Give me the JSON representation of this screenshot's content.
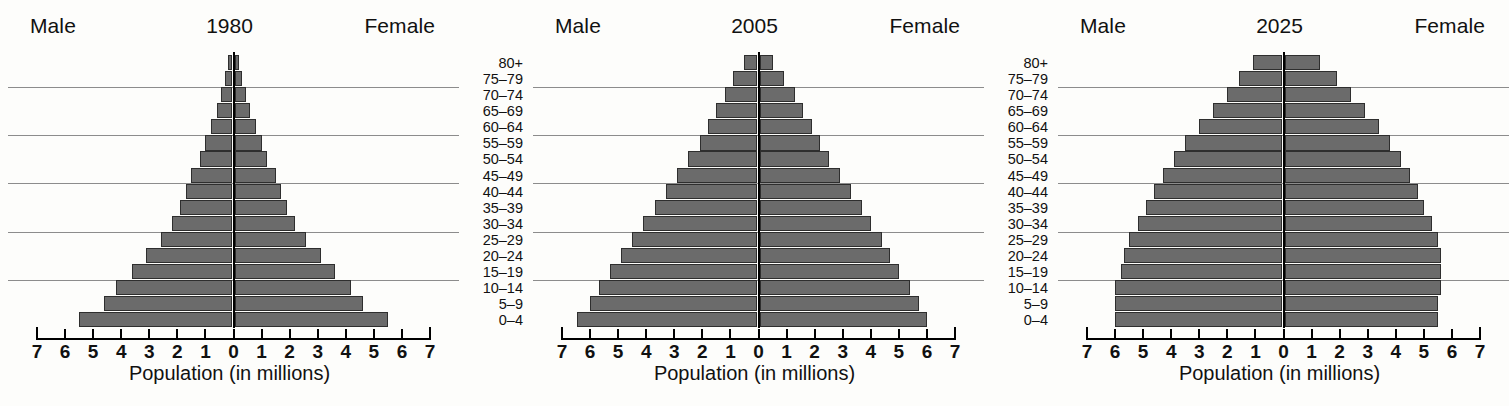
{
  "figure": {
    "axis_title": "Population (in millions)",
    "male_label": "Male",
    "female_label": "Female",
    "x_ticks": [
      "7",
      "6",
      "5",
      "4",
      "3",
      "2",
      "1",
      "0",
      "1",
      "2",
      "3",
      "4",
      "5",
      "6",
      "7"
    ],
    "age_groups": [
      "80+",
      "75–79",
      "70–74",
      "65–69",
      "60–64",
      "55–59",
      "50–54",
      "45–49",
      "40–44",
      "35–39",
      "30–34",
      "25–29",
      "20–24",
      "15–19",
      "10–14",
      "5–9",
      "0–4"
    ],
    "bar_color": "#6b6b6b",
    "bar_edge_color": "#2e2e2e",
    "gridline_color": "#8c8c8c",
    "axis_color": "#000000"
  },
  "chart_data": [
    {
      "type": "bar",
      "title": "1980",
      "subtitle": "",
      "xlabel": "Population (in millions)",
      "ylabel": "",
      "xlim": [
        -7,
        7
      ],
      "grid": true,
      "legend_position": "top",
      "categories": [
        "0–4",
        "5–9",
        "10–14",
        "15–19",
        "20–24",
        "25–29",
        "30–34",
        "35–39",
        "40–44",
        "45–49",
        "50–54",
        "55–59",
        "60–64",
        "65–69",
        "70–74",
        "75–79",
        "80+"
      ],
      "series": [
        {
          "name": "Male",
          "values": [
            5.5,
            4.6,
            4.2,
            3.6,
            3.1,
            2.6,
            2.2,
            1.9,
            1.7,
            1.5,
            1.2,
            1.0,
            0.8,
            0.6,
            0.45,
            0.3,
            0.2
          ]
        },
        {
          "name": "Female",
          "values": [
            5.5,
            4.6,
            4.2,
            3.6,
            3.1,
            2.6,
            2.2,
            1.9,
            1.7,
            1.5,
            1.2,
            1.0,
            0.8,
            0.6,
            0.45,
            0.3,
            0.2
          ]
        }
      ]
    },
    {
      "type": "bar",
      "title": "2005",
      "subtitle": "",
      "xlabel": "Population (in millions)",
      "ylabel": "",
      "xlim": [
        -7,
        7
      ],
      "grid": true,
      "legend_position": "top",
      "categories": [
        "0–4",
        "5–9",
        "10–14",
        "15–19",
        "20–24",
        "25–29",
        "30–34",
        "35–39",
        "40–44",
        "45–49",
        "50–54",
        "55–59",
        "60–64",
        "65–69",
        "70–74",
        "75–79",
        "80+"
      ],
      "series": [
        {
          "name": "Male",
          "values": [
            6.45,
            6.0,
            5.7,
            5.3,
            4.9,
            4.5,
            4.1,
            3.7,
            3.3,
            2.9,
            2.5,
            2.1,
            1.8,
            1.5,
            1.2,
            0.9,
            0.5
          ]
        },
        {
          "name": "Female",
          "values": [
            6.0,
            5.7,
            5.4,
            5.0,
            4.7,
            4.4,
            4.0,
            3.7,
            3.3,
            2.9,
            2.5,
            2.2,
            1.9,
            1.6,
            1.3,
            0.9,
            0.5
          ]
        }
      ]
    },
    {
      "type": "bar",
      "title": "2025",
      "subtitle": "",
      "xlabel": "Population (in millions)",
      "ylabel": "",
      "xlim": [
        -7,
        7
      ],
      "grid": true,
      "legend_position": "top",
      "categories": [
        "0–4",
        "5–9",
        "10–14",
        "15–19",
        "20–24",
        "25–29",
        "30–34",
        "35–39",
        "40–44",
        "45–49",
        "50–54",
        "55–59",
        "60–64",
        "65–69",
        "70–74",
        "75–79",
        "80+"
      ],
      "series": [
        {
          "name": "Male",
          "values": [
            6.0,
            6.0,
            6.0,
            5.8,
            5.7,
            5.5,
            5.2,
            4.9,
            4.6,
            4.3,
            3.9,
            3.5,
            3.0,
            2.5,
            2.0,
            1.6,
            1.1
          ]
        },
        {
          "name": "Female",
          "values": [
            5.5,
            5.5,
            5.6,
            5.6,
            5.6,
            5.5,
            5.3,
            5.0,
            4.8,
            4.5,
            4.2,
            3.8,
            3.4,
            2.9,
            2.4,
            1.9,
            1.3
          ]
        }
      ]
    }
  ]
}
